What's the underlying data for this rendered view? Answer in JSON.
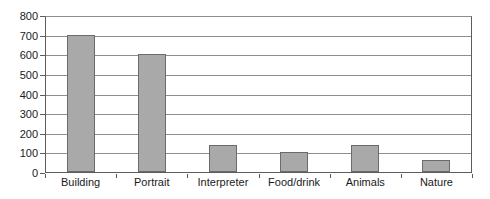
{
  "chart_data": {
    "type": "bar",
    "title": "",
    "subtitle": "",
    "xlabel": "",
    "ylabel": "",
    "categories": [
      "Building",
      "Portrait",
      "Interpreter",
      "Food/drink",
      "Animals",
      "Nature"
    ],
    "values": [
      700,
      600,
      140,
      100,
      140,
      60
    ],
    "ylim": [
      0,
      800
    ],
    "ytick_step": 100,
    "yticks": [
      800,
      700,
      600,
      500,
      400,
      300,
      200,
      100,
      0
    ],
    "ytick_labels": [
      "800",
      "700",
      "600",
      "500",
      "400",
      "300",
      "200",
      "100",
      "0"
    ],
    "grid": true,
    "grid_axis": "y",
    "legend": false,
    "legend_position": "none",
    "series": [
      {
        "name": "",
        "values": [
          700,
          600,
          140,
          100,
          140,
          60
        ]
      }
    ],
    "colors": {
      "bar_fill": "#a9a9a9",
      "bar_border": "#6b6b6b",
      "gridline": "#8d8d8d",
      "axis": "#5c5c5c",
      "text": "#1a1a1a",
      "background": "#ffffff"
    }
  }
}
